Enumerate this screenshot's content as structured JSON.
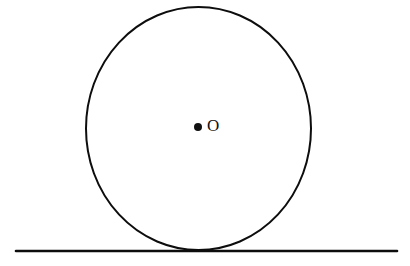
{
  "figure": {
    "background_color": "#ffffff",
    "stroke_color": "#0d0d0d",
    "label_color": "#111111",
    "width": 410,
    "height": 266
  },
  "circle": {
    "center_label": "O",
    "center_x": 198.5,
    "center_y": 128.5,
    "radius_x": 112.5,
    "radius_y": 121.5,
    "stroke_width": 2,
    "fill": "none"
  },
  "center_point": {
    "label": "O",
    "dot_x": 198,
    "dot_y": 127,
    "dot_radius": 4,
    "label_x": 207,
    "label_y": 127
  },
  "tangent_line": {
    "name": "horizontal-tangent-line",
    "x_start": 16,
    "x_end": 397,
    "y": 251,
    "stroke_width": 2.6
  },
  "tangent_point": {
    "x": 198.5,
    "y": 250
  }
}
